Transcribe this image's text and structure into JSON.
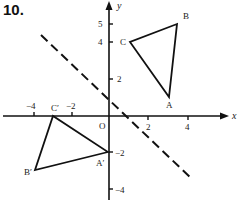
{
  "problem_number": "10.",
  "axes": {
    "x_label": "x",
    "y_label": "y",
    "origin_label": "O",
    "x_ticks": [
      {
        "value": -4,
        "label": "−4"
      },
      {
        "value": -2,
        "label": "−2"
      },
      {
        "value": 2,
        "label": "2"
      },
      {
        "value": 4,
        "label": "4"
      }
    ],
    "y_ticks": [
      {
        "value": 5,
        "label": "5"
      },
      {
        "value": 4,
        "label": "4"
      },
      {
        "value": 2,
        "label": "2"
      },
      {
        "value": -2,
        "label": "−2"
      },
      {
        "value": -4,
        "label": "−4"
      }
    ]
  },
  "triangles": [
    {
      "name": "ABC",
      "vertices": [
        {
          "label": "A",
          "x": 3,
          "y": 1
        },
        {
          "label": "B",
          "x": 4,
          "y": 5
        },
        {
          "label": "C",
          "x": 1,
          "y": 4
        }
      ]
    },
    {
      "name": "A'B'C'",
      "vertices": [
        {
          "label": "A′",
          "x": 0,
          "y": -2
        },
        {
          "label": "B′",
          "x": -4,
          "y": -3
        },
        {
          "label": "C′",
          "x": -3,
          "y": 0
        }
      ]
    }
  ],
  "mirror_line": {
    "style": "dashed",
    "equation": "y = -x + 1"
  }
}
